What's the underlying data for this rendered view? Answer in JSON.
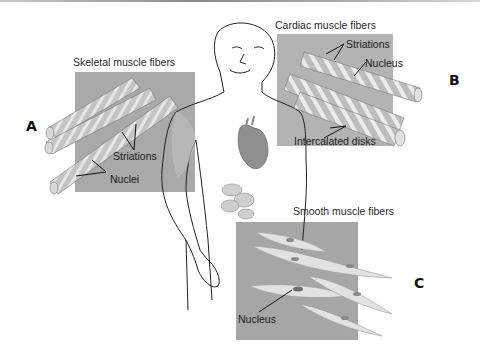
{
  "figure": {
    "panels": {
      "skeletal": {
        "letter": "A",
        "title": "Skeletal muscle fibers",
        "labels": [
          "Striations",
          "Nuclei"
        ]
      },
      "cardiac": {
        "letter": "B",
        "title": "Cardiac muscle fibers",
        "labels": [
          "Striations",
          "Nucleus",
          "Intercalated disks"
        ]
      },
      "smooth": {
        "letter": "C",
        "title": "Smooth muscle fibers",
        "labels": [
          "Nucleus"
        ]
      }
    },
    "colors": {
      "panel_bg": "#a9a9a9",
      "fiber_fill": "#c9c9c9",
      "fiber_stripe": "#e9e9e9",
      "outline": "#222222"
    }
  }
}
